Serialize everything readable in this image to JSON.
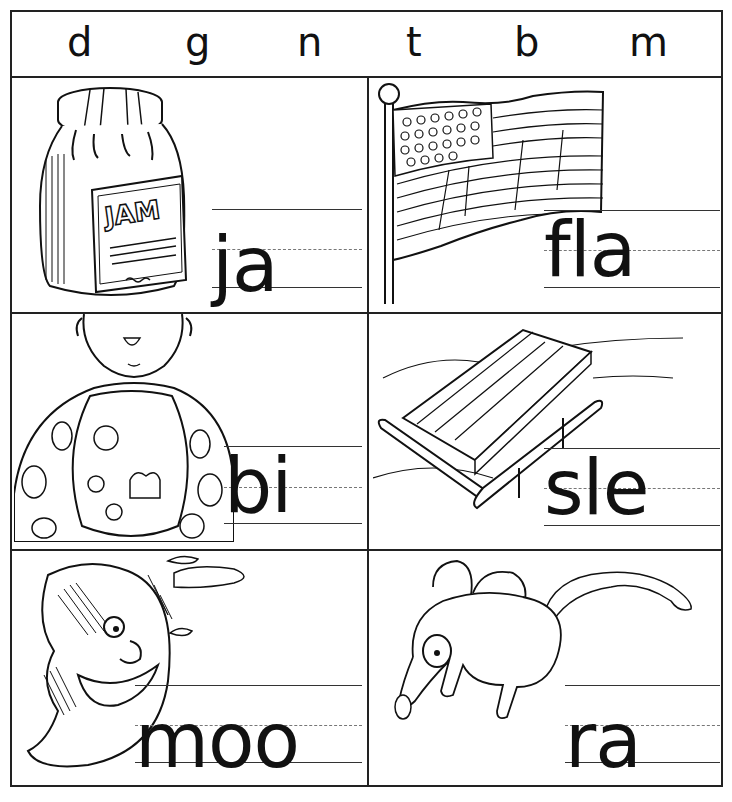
{
  "worksheet": {
    "header_letters": [
      "d",
      "g",
      "n",
      "t",
      "b",
      "m"
    ],
    "cells": [
      {
        "picture": "jam jar",
        "picture_label": "JAM",
        "word_stem": "ja"
      },
      {
        "picture": "flag",
        "word_stem": "fla"
      },
      {
        "picture": "child with bib",
        "word_stem": "bi"
      },
      {
        "picture": "sled",
        "word_stem": "sle"
      },
      {
        "picture": "crescent moon face",
        "word_stem": "moo"
      },
      {
        "picture": "rat",
        "word_stem": "ra"
      }
    ]
  }
}
